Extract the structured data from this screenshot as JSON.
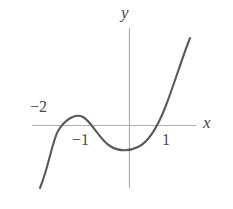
{
  "figure": {
    "background_color": "#ffffff",
    "width": 233,
    "height": 209
  },
  "axes": {
    "x_axis": {
      "name": "x-axis",
      "label": "x",
      "color": "#b0b0b0",
      "y_pixel": 125,
      "x_start": 32,
      "x_end": 196
    },
    "y_axis": {
      "name": "y-axis",
      "label": "y",
      "color": "#b0b0b0",
      "x_pixel": 129,
      "y_start": 28,
      "y_end": 188
    }
  },
  "tick_labels": {
    "neg_two": "−2",
    "neg_one": "−1",
    "pos_one": "1"
  },
  "curve": {
    "name": "cubic-curve",
    "color": "#5a5a5a",
    "stroke_width": 2.1,
    "path": "M 40 188 C 49 166 52 142 58 131 C 65 119 76 113 83 117 C 92 122 99 139 110 146 C 119 152 130 151 138 147 C 149 142 157 128 165 108 C 174 85 182 58 190 38"
  },
  "chart_data": {
    "type": "line",
    "title": "",
    "xlabel": "x",
    "ylabel": "y",
    "grid": false,
    "legend": null,
    "xlim": [
      -2.6,
      1.65
    ],
    "ylim": [
      -1.6,
      3.1
    ],
    "xticks": [
      -2,
      -1,
      1
    ],
    "xticklabels": [
      "−2",
      "−1",
      "1"
    ],
    "yticks": [],
    "yticklabels": [],
    "annotations": [],
    "series": [
      {
        "name": "y = x(x+1)(x+2)",
        "x": [
          -2.3,
          -2.2,
          -2.1,
          -2.0,
          -1.9,
          -1.8,
          -1.7,
          -1.6,
          -1.5,
          -1.4,
          -1.3,
          -1.2,
          -1.1,
          -1.0,
          -0.9,
          -0.8,
          -0.7,
          -0.6,
          -0.5,
          -0.4,
          -0.3,
          -0.2,
          -0.1,
          0.0,
          0.1,
          0.2,
          0.3,
          0.4,
          0.5,
          0.6,
          0.7,
          0.8,
          0.9,
          1.0,
          1.1,
          1.2,
          1.3,
          1.4,
          1.5
        ],
        "y": [
          -1.2,
          -0.77,
          -0.44,
          0.0,
          0.21,
          0.34,
          0.41,
          0.42,
          0.38,
          0.34,
          0.27,
          0.19,
          0.1,
          0.0,
          -0.1,
          -0.19,
          -0.27,
          -0.34,
          -0.38,
          -0.42,
          -0.41,
          -0.34,
          -0.21,
          0.0,
          0.23,
          0.53,
          0.9,
          1.34,
          1.88,
          2.5,
          3.22,
          4.03,
          4.96,
          6.0,
          7.16,
          8.45,
          9.88,
          11.42,
          13.12
        ]
      }
    ],
    "features": {
      "x_intercepts": [
        -2,
        -1,
        0
      ],
      "local_maximum": {
        "x": -1.58,
        "y": 0.38
      },
      "local_minimum": {
        "x": -0.42,
        "y": -0.38
      }
    }
  }
}
